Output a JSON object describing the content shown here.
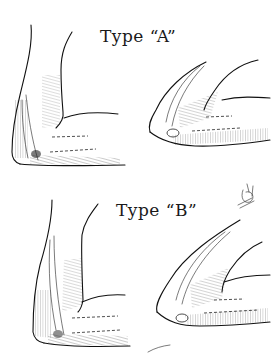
{
  "figure": {
    "labels": {
      "type_a": "Type “A”",
      "type_b": "Type “B”"
    },
    "panels": [
      {
        "id": "type-a-extended",
        "row": 1,
        "position": "left",
        "description": "elbow-extended-view"
      },
      {
        "id": "type-a-flexed",
        "row": 1,
        "position": "right",
        "description": "elbow-flexed-view"
      },
      {
        "id": "type-b-extended",
        "row": 2,
        "position": "left",
        "description": "elbow-extended-view"
      },
      {
        "id": "type-b-flexed",
        "row": 2,
        "position": "right",
        "description": "elbow-flexed-view"
      }
    ],
    "colors": {
      "ink": "#111111",
      "background": "#ffffff"
    }
  }
}
